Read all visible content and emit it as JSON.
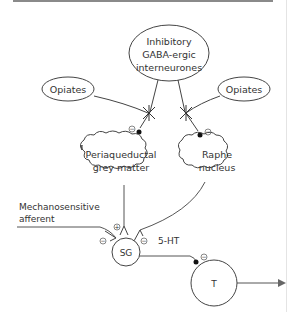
{
  "diagram": {
    "nodes": {
      "gaba": {
        "line1": "Inhibitory",
        "line2": "GABA-ergic",
        "line3": "interneurones"
      },
      "opiates_left": {
        "label": "Opiates"
      },
      "opiates_right": {
        "label": "Opiates"
      },
      "pag": {
        "line1": "Periaqueductal",
        "line2": "grey matter"
      },
      "raphe": {
        "line1": "Raphe",
        "line2": "nucleus"
      },
      "sg": {
        "label": "SG"
      },
      "t": {
        "label": "T"
      }
    },
    "labels": {
      "afferent_line1": "Mechanosensitive",
      "afferent_line2": "afferent",
      "serotonin": "5-HT"
    },
    "signs": {
      "inhibit": "−",
      "excite": "+"
    }
  }
}
